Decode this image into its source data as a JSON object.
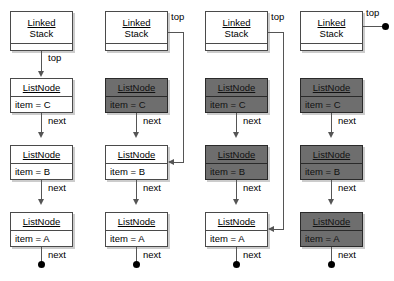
{
  "diagram": {
    "labels": {
      "stack_line1": "Linked",
      "stack_line2": "Stack",
      "node_title": "ListNode",
      "top": "top",
      "next": "next"
    },
    "colors": {
      "shaded_fill": "#6e6e6e",
      "plain_fill": "#ffffff",
      "stroke": "#4a4a4a",
      "connector": "#555555",
      "terminator": "#000000"
    },
    "columns": [
      {
        "id": "stage-1",
        "stack": {
          "line1": "Linked",
          "line2": "Stack"
        },
        "top_label": "top",
        "top_label_position": "below-box",
        "top_points_to": "node-c",
        "top_is_null": false,
        "nodes": [
          {
            "id": "node-c",
            "title": "ListNode",
            "item": "item = C",
            "shaded": false,
            "next_label": "next"
          },
          {
            "id": "node-b",
            "title": "ListNode",
            "item": "item = B",
            "shaded": false,
            "next_label": "next"
          },
          {
            "id": "node-a",
            "title": "ListNode",
            "item": "item = A",
            "shaded": false,
            "next_label": "next"
          }
        ]
      },
      {
        "id": "stage-2",
        "stack": {
          "line1": "Linked",
          "line2": "Stack"
        },
        "top_label": "top",
        "top_label_position": "right-of-box",
        "top_points_to": "node-b",
        "top_is_null": false,
        "nodes": [
          {
            "id": "node-c",
            "title": "ListNode",
            "item": "item = C",
            "shaded": true,
            "next_label": "next"
          },
          {
            "id": "node-b",
            "title": "ListNode",
            "item": "item = B",
            "shaded": false,
            "next_label": "next"
          },
          {
            "id": "node-a",
            "title": "ListNode",
            "item": "item = A",
            "shaded": false,
            "next_label": "next"
          }
        ]
      },
      {
        "id": "stage-3",
        "stack": {
          "line1": "Linked",
          "line2": "Stack"
        },
        "top_label": "top",
        "top_label_position": "right-of-box",
        "top_points_to": "node-a",
        "top_is_null": false,
        "nodes": [
          {
            "id": "node-c",
            "title": "ListNode",
            "item": "item = C",
            "shaded": true,
            "next_label": "next"
          },
          {
            "id": "node-b",
            "title": "ListNode",
            "item": "item = B",
            "shaded": true,
            "next_label": "next"
          },
          {
            "id": "node-a",
            "title": "ListNode",
            "item": "item = A",
            "shaded": false,
            "next_label": "next"
          }
        ]
      },
      {
        "id": "stage-4",
        "stack": {
          "line1": "Linked",
          "line2": "Stack"
        },
        "top_label": "top",
        "top_label_position": "right-of-box",
        "top_points_to": null,
        "top_is_null": true,
        "nodes": [
          {
            "id": "node-c",
            "title": "ListNode",
            "item": "item = C",
            "shaded": true,
            "next_label": "next"
          },
          {
            "id": "node-b",
            "title": "ListNode",
            "item": "item = B",
            "shaded": true,
            "next_label": "next"
          },
          {
            "id": "node-a",
            "title": "ListNode",
            "item": "item = A",
            "shaded": true,
            "next_label": "next"
          }
        ]
      }
    ]
  }
}
